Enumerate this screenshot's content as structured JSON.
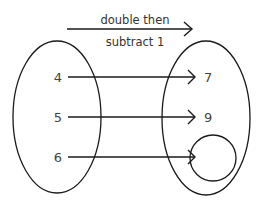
{
  "rule": {
    "line1": "double then",
    "line2": "subtract 1"
  },
  "domain": {
    "values": [
      "4",
      "5",
      "6"
    ]
  },
  "range": {
    "values": [
      "7",
      "9",
      ""
    ],
    "empty_slot": "answer-circle"
  },
  "mappings": [
    {
      "from": "4",
      "to": "7"
    },
    {
      "from": "5",
      "to": "9"
    },
    {
      "from": "6",
      "to": ""
    }
  ],
  "colors": {
    "stroke": "#1a1a1a",
    "text": "#444444"
  }
}
